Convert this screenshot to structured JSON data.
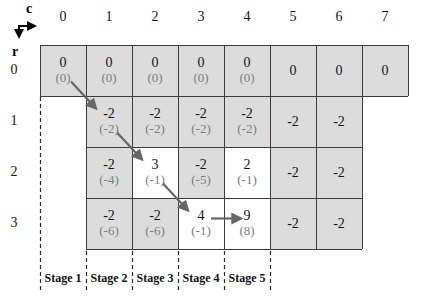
{
  "axis": {
    "col_label": "c",
    "row_label": "r"
  },
  "columns": [
    "0",
    "1",
    "2",
    "3",
    "4",
    "5",
    "6",
    "7"
  ],
  "row_labels": [
    "0",
    "1",
    "2",
    "3"
  ],
  "grid": {
    "rows": [
      {
        "r": 0,
        "cells": [
          {
            "c": 0,
            "main": "0",
            "sub": "(0)",
            "highlight": false
          },
          {
            "c": 1,
            "main": "0",
            "sub": "(0)",
            "highlight": false
          },
          {
            "c": 2,
            "main": "0",
            "sub": "(0)",
            "highlight": false
          },
          {
            "c": 3,
            "main": "0",
            "sub": "(0)",
            "highlight": false
          },
          {
            "c": 4,
            "main": "0",
            "sub": "(0)",
            "highlight": false
          },
          {
            "c": 5,
            "main": "0",
            "sub": null,
            "highlight": false
          },
          {
            "c": 6,
            "main": "0",
            "sub": null,
            "highlight": false
          },
          {
            "c": 7,
            "main": "0",
            "sub": null,
            "highlight": false
          }
        ]
      },
      {
        "r": 1,
        "cells": [
          {
            "c": 1,
            "main": "-2",
            "sub": "(-2)",
            "highlight": false
          },
          {
            "c": 2,
            "main": "-2",
            "sub": "(-2)",
            "highlight": false
          },
          {
            "c": 3,
            "main": "-2",
            "sub": "(-2)",
            "highlight": false
          },
          {
            "c": 4,
            "main": "-2",
            "sub": "(-2)",
            "highlight": false
          },
          {
            "c": 5,
            "main": "-2",
            "sub": null,
            "highlight": false
          },
          {
            "c": 6,
            "main": "-2",
            "sub": null,
            "highlight": false
          }
        ]
      },
      {
        "r": 2,
        "cells": [
          {
            "c": 1,
            "main": "-2",
            "sub": "(-4)",
            "highlight": false
          },
          {
            "c": 2,
            "main": "3",
            "sub": "(-1)",
            "highlight": true
          },
          {
            "c": 3,
            "main": "-2",
            "sub": "(-5)",
            "highlight": false
          },
          {
            "c": 4,
            "main": "2",
            "sub": "(-1)",
            "highlight": true
          },
          {
            "c": 5,
            "main": "-2",
            "sub": null,
            "highlight": false
          },
          {
            "c": 6,
            "main": "-2",
            "sub": null,
            "highlight": false
          }
        ]
      },
      {
        "r": 3,
        "cells": [
          {
            "c": 1,
            "main": "-2",
            "sub": "(-6)",
            "highlight": false
          },
          {
            "c": 2,
            "main": "-2",
            "sub": "(-6)",
            "highlight": false
          },
          {
            "c": 3,
            "main": "4",
            "sub": "(-1)",
            "highlight": true
          },
          {
            "c": 4,
            "main": "9",
            "sub": "(8)",
            "highlight": true
          },
          {
            "c": 5,
            "main": "-2",
            "sub": null,
            "highlight": false
          },
          {
            "c": 6,
            "main": "-2",
            "sub": null,
            "highlight": false
          }
        ]
      }
    ]
  },
  "arrows": [
    {
      "from_r": 0,
      "from_c": 0,
      "to_r": 1,
      "to_c": 1,
      "direction": "diagonal"
    },
    {
      "from_r": 1,
      "from_c": 1,
      "to_r": 2,
      "to_c": 2,
      "direction": "diagonal"
    },
    {
      "from_r": 2,
      "from_c": 2,
      "to_r": 3,
      "to_c": 3,
      "direction": "diagonal"
    },
    {
      "from_r": 3,
      "from_c": 3,
      "to_r": 3,
      "to_c": 4,
      "direction": "horizontal"
    }
  ],
  "stages": [
    "Stage 1",
    "Stage 2",
    "Stage 3",
    "Stage 4",
    "Stage 5"
  ],
  "colors": {
    "cell_fill": "#dcdcdc",
    "highlight_fill": "#ffffff",
    "grid_line": "#3c3c3c",
    "main_text": "#141414",
    "sub_text": "#7d7d7d",
    "arrow": "#666666",
    "dashed_line": "#2a2a2a",
    "axis": "#000000"
  }
}
